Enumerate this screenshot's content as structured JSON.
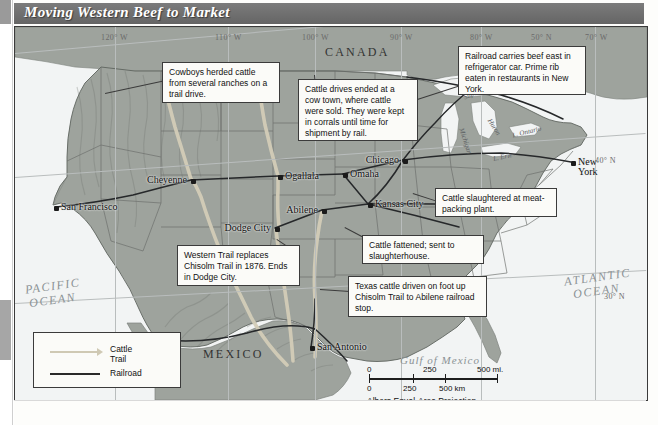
{
  "title": "Moving Western Beef to Market",
  "graticule": {
    "labels": [
      {
        "text": "120° W",
        "x": 86,
        "y": 6
      },
      {
        "text": "110° W",
        "x": 200,
        "y": 6
      },
      {
        "text": "100° W",
        "x": 287,
        "y": 6
      },
      {
        "text": "90° W",
        "x": 375,
        "y": 6
      },
      {
        "text": "80° W",
        "x": 455,
        "y": 6
      },
      {
        "text": "50° N",
        "x": 516,
        "y": 6
      },
      {
        "text": "70° W",
        "x": 570,
        "y": 6
      },
      {
        "text": "40° N",
        "x": 580,
        "y": 129
      },
      {
        "text": "30° N",
        "x": 589,
        "y": 265
      }
    ]
  },
  "geography": {
    "countries": [
      {
        "name": "CANADA",
        "x": 310,
        "y": 18
      },
      {
        "name": "MEXICO",
        "x": 188,
        "y": 320
      }
    ],
    "oceans": [
      {
        "name": "PACIFIC",
        "x": 10,
        "y": 252
      },
      {
        "name": "OCEAN",
        "x": 14,
        "y": 266
      },
      {
        "name": "ATLANTIC",
        "x": 549,
        "y": 243
      },
      {
        "name": "OCEAN",
        "x": 558,
        "y": 257
      }
    ],
    "gulf": {
      "name": "Gulf of Mexico",
      "x": 385,
      "y": 327
    },
    "lakes": [
      {
        "name": "Superior",
        "x": 448,
        "y": 62,
        "rot": -22
      },
      {
        "name": "Michigan",
        "x": 437,
        "y": 110,
        "rot": 72
      },
      {
        "name": "Huron",
        "x": 470,
        "y": 96,
        "rot": 58
      },
      {
        "name": "L. Ontario",
        "x": 497,
        "y": 101,
        "rot": -14
      },
      {
        "name": "L. Erie",
        "x": 478,
        "y": 126,
        "rot": -12
      }
    ]
  },
  "cities": [
    {
      "name": "San Francisco",
      "x": 39,
      "y": 179,
      "lines": 1
    },
    {
      "name": "Cheyenne",
      "x": 176,
      "y": 152,
      "lines": 1,
      "labelLeft": true
    },
    {
      "name": "Ogallala",
      "x": 263,
      "y": 148,
      "lines": 1
    },
    {
      "name": "Omaha",
      "x": 328,
      "y": 146,
      "lines": 1
    },
    {
      "name": "Chicago",
      "x": 388,
      "y": 132,
      "lines": 1,
      "labelLeft": true
    },
    {
      "name": "Abilene",
      "x": 307,
      "y": 182,
      "lines": 1,
      "labelLeft": true
    },
    {
      "name": "Kansas City",
      "x": 353,
      "y": 176,
      "lines": 1
    },
    {
      "name": "Dodge City",
      "x": 260,
      "y": 200,
      "lines": 1,
      "labelLeft": true
    },
    {
      "name": "San Antonio",
      "x": 295,
      "y": 319,
      "lines": 1
    },
    {
      "name": "New York",
      "x": 556,
      "y": 134,
      "lines": 2
    }
  ],
  "callouts": [
    {
      "id": "cowboys",
      "text": "Cowboys herded cattle from several ranches on a trail drive.",
      "x": 147,
      "y": 35,
      "w": 118,
      "h": 41
    },
    {
      "id": "cow-town",
      "text": "Cattle drives ended at a cow town, where cattle were sold. They were kept in corrals until time for shipment by rail.",
      "x": 283,
      "y": 52,
      "w": 120,
      "h": 62
    },
    {
      "id": "railroad-east",
      "text": "Railroad carries beef east in refrigerator car. Prime rib eaten in restaurants in New York.",
      "x": 443,
      "y": 19,
      "w": 128,
      "h": 49
    },
    {
      "id": "slaughter-plant",
      "text": "Cattle slaughtered at meat-packing plant.",
      "x": 420,
      "y": 161,
      "w": 122,
      "h": 29
    },
    {
      "id": "western-trail",
      "text": "Western Trail replaces Chisolm Trail in 1876. Ends in Dodge City.",
      "x": 162,
      "y": 218,
      "w": 123,
      "h": 41
    },
    {
      "id": "cattle-fattened",
      "text": "Cattle fattened; sent to slaughterhouse.",
      "x": 347,
      "y": 208,
      "w": 122,
      "h": 29
    },
    {
      "id": "texas-cattle",
      "text": "Texas cattle driven on foot up Chisolm Trail to Abilene railroad stop.",
      "x": 333,
      "y": 249,
      "w": 139,
      "h": 41
    }
  ],
  "legend": {
    "x": 18,
    "y": 305,
    "w": 148,
    "h": 56,
    "items": [
      {
        "label_line1": "Cattle",
        "label_line2": "Trail",
        "symbol": "cattle-trail-arrow",
        "color": "#cfc9b4"
      },
      {
        "label_line1": "Railroad",
        "label_line2": "",
        "symbol": "railroad-line",
        "color": "#2a2a2a"
      }
    ]
  },
  "scale": {
    "x": 352,
    "y": 338,
    "miles": {
      "ticks": [
        "0",
        "250",
        "500 mi."
      ]
    },
    "km": {
      "ticks": [
        "0",
        "250",
        "500 km"
      ]
    },
    "projection": "Albers Equal-Area Projection"
  },
  "colors": {
    "title_bar": "#6e6e6e",
    "land": "#9ea39d",
    "ocean": "#f2f4f4",
    "cattle_trail": "#cfc9b4",
    "railroad": "#2a2a2a",
    "border": "#3b3b3b"
  }
}
